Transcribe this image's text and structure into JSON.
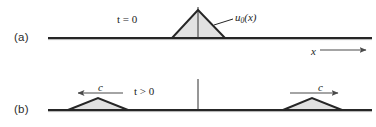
{
  "figure": {
    "title": "",
    "background_color": "#ffffff",
    "line_color": "#262626",
    "shade_color": "#d9d9d9",
    "arrow_color": "#4d4d4d",
    "width": 376,
    "height": 127
  },
  "panels": [
    {
      "id": "a",
      "label": "(a)",
      "time_label": "t = 0",
      "baseline_y": 38,
      "axis_label": "x",
      "axis_arrow": "arrow-right",
      "pulse_label": "u0(x)",
      "pulse_label_base": "u",
      "pulse_label_sub": "0",
      "pulse_label_arg": "(x)",
      "pulses": [
        {
          "name": "initial-pulse",
          "left_x": 172,
          "apex_x": 198,
          "right_x": 225,
          "apex_y": 10
        }
      ],
      "center_line": {
        "x": 198,
        "top_y": 7,
        "bottom_y": 38
      }
    },
    {
      "id": "b",
      "label": "(b)",
      "time_label": "t > 0",
      "baseline_y": 110,
      "pulses": [
        {
          "name": "left-travelling-pulse",
          "left_x": 68,
          "apex_x": 98,
          "right_x": 128,
          "apex_y": 98
        },
        {
          "name": "right-travelling-pulse",
          "left_x": 283,
          "apex_x": 312,
          "right_x": 342,
          "apex_y": 98
        }
      ],
      "center_line": {
        "x": 198,
        "top_y": 79,
        "bottom_y": 110
      },
      "velocity_arrows": [
        {
          "name": "velocity-arrow-left",
          "label": "c",
          "direction": "left",
          "x1": 123,
          "x2": 78,
          "y": 93
        },
        {
          "name": "velocity-arrow-right",
          "label": "c",
          "direction": "right",
          "x1": 290,
          "x2": 338,
          "y": 93
        }
      ]
    }
  ]
}
